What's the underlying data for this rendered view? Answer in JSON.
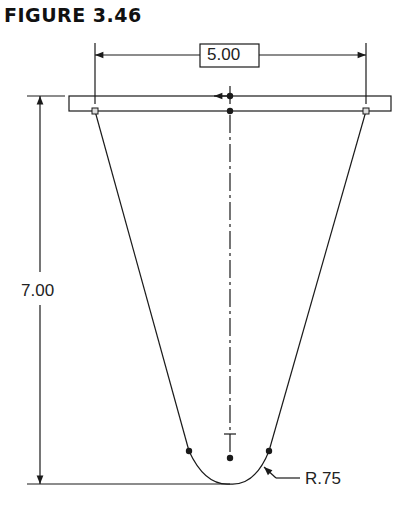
{
  "figure": {
    "title": "FIGURE 3.46"
  },
  "dimensions": {
    "width_label": "5.00",
    "height_label": "7.00",
    "radius_label": "R.75"
  },
  "colors": {
    "line": "#1a1a1a",
    "background": "#ffffff"
  }
}
